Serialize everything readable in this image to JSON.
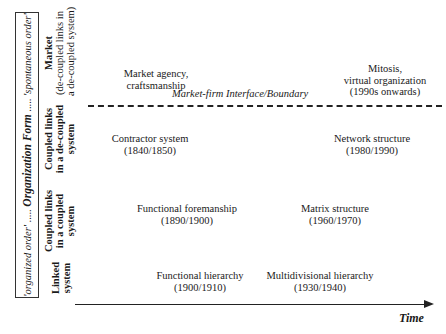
{
  "frame": {
    "left_order": "'organized order'",
    "dots_left": " ..... ",
    "title": "Organization Form",
    "dots_right": " ..... ",
    "right_order": "'spontaneous order'"
  },
  "rows": [
    {
      "bold": "Market",
      "line2": "(de-coupled links in",
      "line3": "a de-coupled system)"
    },
    {
      "bold": "Coupled links",
      "bold2": "in a de-coupled",
      "line3": "system"
    },
    {
      "bold": "Coupled links",
      "bold2": "in a coupled",
      "line3": "system"
    },
    {
      "bold": "Linked",
      "bold2": "system"
    }
  ],
  "boundary": {
    "label": "Market-firm Interface/Boundary"
  },
  "items": [
    {
      "name": "Market agency,",
      "date": "craftsmanship"
    },
    {
      "line1": "Mitosis,",
      "line2": "virtual organization",
      "date": "(1990s onwards)"
    },
    {
      "name": "Contractor system",
      "date": "(1840/1850)"
    },
    {
      "name": "Network structure",
      "date": "(1980/1990)"
    },
    {
      "name": "Functional foremanship",
      "date": "(1890/1900)"
    },
    {
      "name": "Matrix structure",
      "date": "(1960/1970)"
    },
    {
      "name": "Functional hierarchy",
      "date": "(1900/1910)"
    },
    {
      "name": "Multidivisional hierarchy",
      "date": "(1930/1940)"
    }
  ],
  "axis": {
    "label": "Time"
  }
}
